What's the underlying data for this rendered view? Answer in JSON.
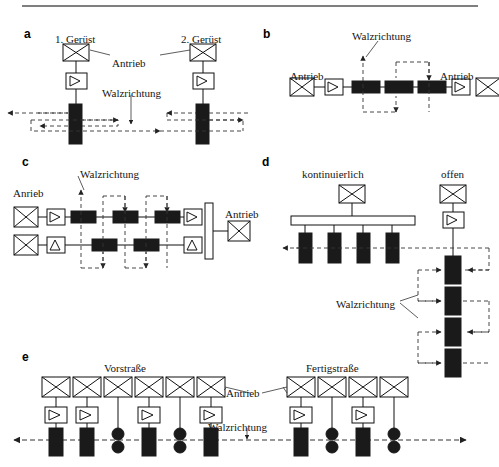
{
  "figure": {
    "type": "technical-diagram",
    "top_rule": true,
    "panels": [
      {
        "id": "a",
        "letter": "a",
        "labels": [
          {
            "text": "1. Gerüst",
            "x": 55,
            "y": 34
          },
          {
            "text": "2. Gerüst",
            "x": 181,
            "y": 34
          },
          {
            "text": "Antrieb",
            "x": 112,
            "y": 58
          },
          {
            "text": "Walzrichtung",
            "x": 102,
            "y": 88
          }
        ]
      },
      {
        "id": "b",
        "letter": "b",
        "labels": [
          {
            "text": "Walzrichtung",
            "x": 352,
            "y": 31
          },
          {
            "text": "Antrieb",
            "x": 290,
            "y": 71
          },
          {
            "text": "Antrieb",
            "x": 440,
            "y": 71
          }
        ]
      },
      {
        "id": "c",
        "letter": "c",
        "labels": [
          {
            "text": "Walzrichtung",
            "x": 80,
            "y": 169
          },
          {
            "text": "Anrieb",
            "x": 13,
            "y": 188
          },
          {
            "text": "Antrieb",
            "x": 225,
            "y": 209
          }
        ]
      },
      {
        "id": "d",
        "letter": "d",
        "labels": [
          {
            "text": "kontinuierlich",
            "x": 302,
            "y": 169
          },
          {
            "text": "offen",
            "x": 441,
            "y": 169
          },
          {
            "text": "Walzrichtung",
            "x": 336,
            "y": 299
          }
        ]
      },
      {
        "id": "e",
        "letter": "e",
        "labels": [
          {
            "text": "Vorstraße",
            "x": 104,
            "y": 363
          },
          {
            "text": "Fertigstraße",
            "x": 306,
            "y": 363
          },
          {
            "text": "Antrieb",
            "x": 226,
            "y": 388
          },
          {
            "text": "Walzrichtung",
            "x": 208,
            "y": 422
          }
        ]
      }
    ],
    "colors": {
      "ink": "#151515",
      "roll_fill": "#1a1a1a",
      "box_stroke": "#111111",
      "box_fill": "#ffffff",
      "dashed": "#333333",
      "rule": "#555555"
    },
    "legend_symbols": {
      "motor": "crossed-box",
      "gearbox": "triangle-box",
      "work_roll": "solid-black-rectangle",
      "roll_pair": "solid-black-circles",
      "path": "dashed-line-with-arrow"
    }
  }
}
